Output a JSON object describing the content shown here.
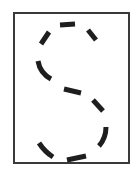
{
  "figure": {
    "letter": "S",
    "style": "dashed-stroke",
    "stroke_color": "#1e1e1e",
    "border_color": "#3a3a3a",
    "background": "#ffffff",
    "frame": {
      "x": 14,
      "y": 13,
      "width": 115,
      "height": 150
    },
    "segments": [
      {
        "id": "top-left",
        "x1": 41,
        "y1": 44,
        "x2": 49,
        "y2": 32
      },
      {
        "id": "top",
        "x1": 60,
        "y1": 25,
        "x2": 75,
        "y2": 24
      },
      {
        "id": "top-right",
        "x1": 88,
        "y1": 30,
        "x2": 96,
        "y2": 40
      },
      {
        "id": "upper-left-curve",
        "path": "M38 61 Q40 73 51 79"
      },
      {
        "id": "center",
        "x1": 64,
        "y1": 89,
        "x2": 81,
        "y2": 93
      },
      {
        "id": "center-right",
        "x1": 93,
        "y1": 100,
        "x2": 103,
        "y2": 111
      },
      {
        "id": "lower-right",
        "path": "M106 127 Q106 138 99 146"
      },
      {
        "id": "lower-left",
        "path": "M39 143 Q45 152 53 157"
      },
      {
        "id": "bottom",
        "x1": 67,
        "y1": 160,
        "x2": 86,
        "y2": 156
      }
    ]
  }
}
